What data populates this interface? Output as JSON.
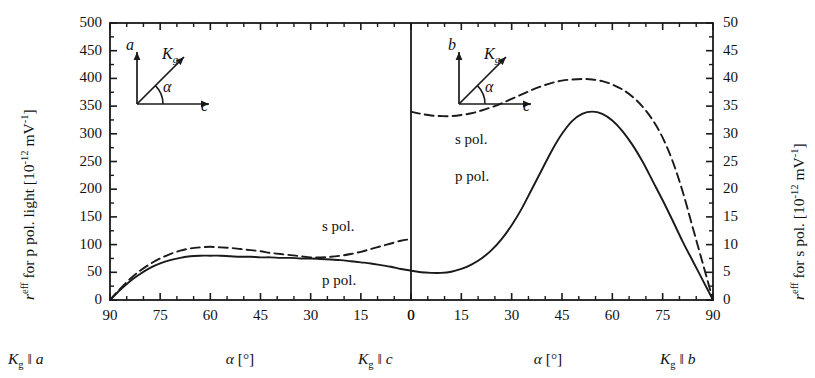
{
  "figure": {
    "background": "#ffffff",
    "line_color": "#1a1a1a",
    "plot_box": {
      "x": 110,
      "y": 23,
      "width": 603,
      "height": 277
    },
    "divider_x": 411
  },
  "axes": {
    "left": {
      "title_prefix": "r",
      "title_sup": "eff",
      "title_mid": " for p pol. light [10",
      "title_sup2": "-12",
      "title_mid2": " mV",
      "title_sup3": "-1",
      "title_suffix": "]",
      "ticks": [
        0,
        50,
        100,
        150,
        200,
        250,
        300,
        350,
        400,
        450,
        500
      ],
      "min": 0,
      "max": 500,
      "minor_per_major": 2
    },
    "right": {
      "title_prefix": "r",
      "title_sup": "eff",
      "title_mid": " for s pol. [10",
      "title_sup2": "-12",
      "title_mid2": " mV",
      "title_sup3": "-1",
      "title_suffix": "]",
      "ticks": [
        0,
        5,
        10,
        15,
        20,
        25,
        30,
        35,
        40,
        45,
        50
      ],
      "min": 0,
      "max": 50,
      "minor_per_major": 2
    },
    "bottom_left": {
      "ticks": [
        90,
        75,
        60,
        45,
        30,
        15,
        0
      ],
      "title": "α [°]",
      "start_corner": "K",
      "start_corner_sub": "g",
      "start_corner_rest": " ‖ a",
      "end_corner": "K",
      "end_corner_sub": "g",
      "end_corner_rest": " ‖ c"
    },
    "bottom_right": {
      "ticks": [
        0,
        15,
        30,
        45,
        60,
        75,
        90
      ],
      "title": "α [°]",
      "end_corner": "K",
      "end_corner_sub": "g",
      "end_corner_rest": " ‖ b"
    }
  },
  "insets": {
    "left": {
      "vertical_axis": "a",
      "horizontal_axis": "c",
      "vector": "K",
      "vector_sub": "g",
      "angle": "α"
    },
    "right": {
      "vertical_axis": "b",
      "horizontal_axis": "c",
      "vector": "K",
      "vector_sub": "g",
      "angle": "α"
    }
  },
  "curve_labels": {
    "left_s": "s pol.",
    "left_p": "p pol.",
    "right_s": "s pol.",
    "right_p": "p pol."
  },
  "chart_data": {
    "type": "line",
    "title": "",
    "xlabel": "α [°]",
    "ylabel": "r^eff for p pol. light [10^-12 mV^-1]",
    "ylabel_right": "r^eff for s pol. [10^-12 mV^-1]",
    "ylim": [
      0,
      500
    ],
    "ylim_right": [
      0,
      50
    ],
    "grid": false,
    "legend": [
      "s pol.",
      "p pol."
    ],
    "legend_position": "inline-annotations",
    "panels": [
      {
        "name": "left-panel",
        "description": "K_g rotates from parallel to a (alpha=90) to parallel to c (alpha=0)",
        "x_axis_direction": "descending",
        "xlim": [
          90,
          0
        ],
        "series": [
          {
            "name": "p pol.",
            "style": "solid",
            "axis": "left",
            "x": [
              90,
              87,
              84,
              81,
              78,
              75,
              72,
              69,
              66,
              63,
              60,
              57,
              54,
              51,
              48,
              45,
              42,
              39,
              36,
              33,
              30,
              27,
              24,
              21,
              18,
              15,
              12,
              9,
              6,
              3,
              0
            ],
            "y": [
              0,
              18,
              34,
              47,
              58,
              66,
              72,
              76,
              79,
              80,
              80,
              80,
              79,
              78,
              78,
              77,
              77,
              76,
              76,
              75,
              75,
              74,
              73,
              72,
              70,
              68,
              66,
              63,
              60,
              56,
              53
            ]
          },
          {
            "name": "s pol.",
            "style": "dashed",
            "axis": "left",
            "x": [
              90,
              87,
              84,
              81,
              78,
              75,
              72,
              69,
              66,
              63,
              60,
              57,
              54,
              51,
              48,
              45,
              42,
              39,
              36,
              33,
              30,
              27,
              24,
              21,
              18,
              15,
              12,
              9,
              6,
              3,
              0
            ],
            "y": [
              0,
              20,
              38,
              53,
              65,
              75,
              83,
              89,
              93,
              95,
              96,
              95,
              94,
              92,
              90,
              88,
              85,
              83,
              81,
              79,
              77,
              77,
              78,
              80,
              83,
              87,
              92,
              97,
              102,
              107,
              110
            ]
          }
        ]
      },
      {
        "name": "right-panel",
        "description": "K_g rotates from parallel to c (alpha=0) to parallel to b (alpha=90)",
        "x_axis_direction": "ascending",
        "xlim": [
          0,
          90
        ],
        "series": [
          {
            "name": "p pol.",
            "style": "solid",
            "axis": "right",
            "x": [
              0,
              3,
              6,
              9,
              12,
              15,
              18,
              21,
              24,
              27,
              30,
              33,
              36,
              39,
              42,
              45,
              48,
              51,
              54,
              57,
              60,
              63,
              66,
              69,
              72,
              75,
              78,
              81,
              84,
              87,
              90
            ],
            "y": [
              5.3,
              5.0,
              4.9,
              4.9,
              5.1,
              5.6,
              6.4,
              7.5,
              9.0,
              11.0,
              13.5,
              16.5,
              20.0,
              23.5,
              27.0,
              30.0,
              32.3,
              33.6,
              34.0,
              33.6,
              32.4,
              30.5,
              28.0,
              25.0,
              21.5,
              18.0,
              14.3,
              10.5,
              7.0,
              3.5,
              0
            ]
          },
          {
            "name": "s pol.",
            "style": "dashed",
            "axis": "right",
            "x": [
              0,
              3,
              6,
              9,
              12,
              15,
              18,
              21,
              24,
              27,
              30,
              33,
              36,
              39,
              42,
              45,
              48,
              51,
              54,
              57,
              60,
              63,
              66,
              69,
              72,
              75,
              78,
              81,
              84,
              87,
              90
            ],
            "y": [
              34.0,
              33.6,
              33.3,
              33.2,
              33.2,
              33.4,
              33.7,
              34.2,
              34.8,
              35.5,
              36.3,
              37.1,
              37.9,
              38.6,
              39.2,
              39.6,
              39.8,
              39.9,
              39.8,
              39.5,
              38.9,
              38.0,
              36.7,
              34.9,
              32.5,
              29.3,
              25.0,
              19.5,
              13.0,
              6.5,
              0
            ]
          }
        ]
      }
    ]
  }
}
